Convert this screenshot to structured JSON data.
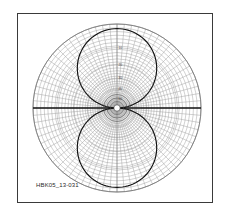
{
  "figure": {
    "id_label": "HBK05_13-031",
    "background_color": "#ffffff",
    "frame_color": "#3a3a3a",
    "curve_color": "#111111",
    "grid_color": "#9a9a9a",
    "axis_color": "#151515"
  },
  "chart_data": {
    "type": "line",
    "subtype": "polar-radiation-pattern",
    "title": "",
    "subtitle": "",
    "xlabel": "",
    "ylabel": "",
    "legend": [],
    "grid": true,
    "legend_position": "none",
    "coordinate_system": "polar",
    "angular_axis": {
      "unit": "degrees",
      "range": [
        0,
        360
      ],
      "spoke_interval_deg": 5,
      "spoke_count": 72,
      "major_spoke_interval_deg": 30,
      "zero_direction": "right",
      "direction": "counterclockwise"
    },
    "radial_axis": {
      "unit": "dB",
      "scale": "logarithmic",
      "outer_value_db": 0,
      "center_value_db": -60,
      "ring_labels": [
        "0",
        "10",
        "20",
        "30",
        "40",
        "50",
        "60"
      ],
      "ring_values_db": [
        0,
        -10,
        -20,
        -30,
        -40,
        -50,
        -60
      ],
      "ring_radius_fraction": [
        1.0,
        0.72,
        0.52,
        0.355,
        0.225,
        0.115,
        0.0
      ],
      "minor_ring_count": 36
    },
    "annotations": [
      {
        "text": "HBK05_13-031",
        "position": "bottom-left"
      }
    ],
    "series": [
      {
        "name": "dipole-pattern",
        "description": "Figure-eight dipole radiation pattern, two tangent lobes above and below the horizontal axis",
        "color": "#111111",
        "theta_deg": [
          0,
          10,
          20,
          30,
          40,
          50,
          60,
          70,
          80,
          90,
          100,
          110,
          120,
          130,
          140,
          150,
          160,
          170,
          180,
          190,
          200,
          210,
          220,
          230,
          240,
          250,
          260,
          270,
          280,
          290,
          300,
          310,
          320,
          330,
          340,
          350,
          360
        ],
        "values_normalized": [
          0.0,
          0.17,
          0.34,
          0.5,
          0.64,
          0.77,
          0.87,
          0.94,
          0.98,
          1.0,
          0.98,
          0.94,
          0.87,
          0.77,
          0.64,
          0.5,
          0.34,
          0.17,
          0.0,
          0.17,
          0.34,
          0.5,
          0.64,
          0.77,
          0.87,
          0.94,
          0.98,
          1.0,
          0.98,
          0.94,
          0.87,
          0.77,
          0.64,
          0.5,
          0.34,
          0.17,
          0.0
        ]
      }
    ],
    "lobes": [
      {
        "name": "upper-lobe",
        "peak_angle_deg": 90,
        "peak_value": 1.0
      },
      {
        "name": "lower-lobe",
        "peak_angle_deg": 270,
        "peak_value": 1.0
      }
    ],
    "nulls_deg": [
      0,
      180
    ]
  }
}
